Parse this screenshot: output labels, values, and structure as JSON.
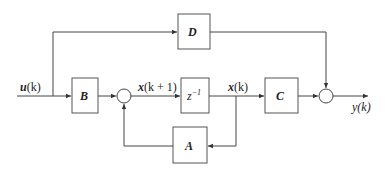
{
  "diagram": {
    "type": "state-space block diagram (discrete-time)",
    "blocks": {
      "D": {
        "label": "D"
      },
      "B": {
        "label": "B"
      },
      "delay": {
        "label": "z",
        "sup": "-1"
      },
      "C": {
        "label": "C"
      },
      "A": {
        "label": "A"
      }
    },
    "signals": {
      "input": "u(k)",
      "next_state": "x(k + 1)",
      "state": "x(k)",
      "output": "y(k)"
    },
    "summing_junctions": 2,
    "colors": {
      "line": "#444444",
      "background": "#ffffff"
    }
  }
}
